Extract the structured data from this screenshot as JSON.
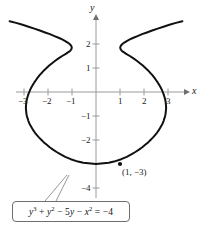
{
  "figure": {
    "width": 204,
    "height": 226,
    "background": "#ffffff",
    "curve_color": "#111111",
    "axis_color": "#9a9a9a",
    "text_color": "#1a1a1a"
  },
  "axes": {
    "x_label": "x",
    "y_label": "y",
    "origin_px": {
      "x": 96,
      "y": 92
    },
    "unit_px": 24,
    "x_ticks": [
      {
        "value": -3,
        "label": "−3"
      },
      {
        "value": -2,
        "label": "−2"
      },
      {
        "value": -1,
        "label": "−1"
      },
      {
        "value": 1,
        "label": "1"
      },
      {
        "value": 2,
        "label": "2"
      },
      {
        "value": 3,
        "label": "3"
      }
    ],
    "y_ticks": [
      {
        "value": 2,
        "label": "2"
      },
      {
        "value": 1,
        "label": "1"
      },
      {
        "value": -1,
        "label": "−1"
      },
      {
        "value": -2,
        "label": "−2"
      },
      {
        "value": -4,
        "label": "−4"
      }
    ]
  },
  "annotations": {
    "point_label": "(1, −3)",
    "point_value": {
      "x": 1,
      "y": -3
    },
    "equation_parts": {
      "y_cubed_base": "y",
      "y_cubed_exp": "3",
      "plus_1": " + ",
      "y_squared_base": "y",
      "y_squared_exp": "2",
      "minus_1": " − 5",
      "five_y": "y",
      "minus_2": " − ",
      "x_squared_base": "x",
      "x_squared_exp": "2",
      "equals": " = −4"
    },
    "equation_plain": "y³ + y² − 5y − x² = −4"
  },
  "chart_data": {
    "type": "line",
    "title": "",
    "xlabel": "x",
    "ylabel": "y",
    "xlim": [
      -3.8,
      3.8
    ],
    "ylim": [
      -4.6,
      3.0
    ],
    "grid": false,
    "legend": null,
    "equation": "y^3 + y^2 - 5y - x^2 = -4",
    "annotated_points": [
      {
        "x": 1,
        "y": -3,
        "label": "(1, −3)"
      }
    ],
    "x_ticks": [
      -3,
      -2,
      -1,
      1,
      2,
      3
    ],
    "y_ticks": [
      2,
      1,
      -1,
      -2,
      -4
    ],
    "series": [
      {
        "name": "right branch (x = +sqrt)",
        "points": [
          [
            0.0,
            -3.0
          ],
          [
            0.53,
            -2.95
          ],
          [
            0.75,
            -2.9
          ],
          [
            1.05,
            -2.8
          ],
          [
            1.28,
            -2.7
          ],
          [
            1.47,
            -2.6
          ],
          [
            1.64,
            -2.5
          ],
          [
            1.79,
            -2.4
          ],
          [
            1.93,
            -2.3
          ],
          [
            2.05,
            -2.2
          ],
          [
            2.17,
            -2.1
          ],
          [
            2.27,
            -2.0
          ],
          [
            2.37,
            -1.9
          ],
          [
            2.46,
            -1.8
          ],
          [
            2.54,
            -1.7
          ],
          [
            2.61,
            -1.6
          ],
          [
            2.67,
            -1.5
          ],
          [
            2.73,
            -1.4
          ],
          [
            2.78,
            -1.3
          ],
          [
            2.82,
            -1.2
          ],
          [
            2.85,
            -1.1
          ],
          [
            2.88,
            -1.0
          ],
          [
            2.9,
            -0.9
          ],
          [
            2.91,
            -0.8
          ],
          [
            2.92,
            -0.7
          ],
          [
            2.92,
            -0.6
          ],
          [
            2.91,
            -0.5
          ],
          [
            2.9,
            -0.4
          ],
          [
            2.88,
            -0.3
          ],
          [
            2.85,
            -0.2
          ],
          [
            2.82,
            -0.1
          ],
          [
            2.78,
            0.0
          ],
          [
            2.74,
            0.1
          ],
          [
            2.69,
            0.2
          ],
          [
            2.63,
            0.3
          ],
          [
            2.57,
            0.4
          ],
          [
            2.5,
            0.5
          ],
          [
            2.43,
            0.6
          ],
          [
            2.35,
            0.7
          ],
          [
            2.26,
            0.8
          ],
          [
            2.17,
            0.9
          ],
          [
            2.06,
            1.0
          ],
          [
            1.95,
            1.1
          ],
          [
            1.83,
            1.2
          ],
          [
            1.7,
            1.3
          ],
          [
            1.56,
            1.4
          ],
          [
            1.41,
            1.5
          ],
          [
            1.24,
            1.6
          ],
          [
            1.2,
            1.63
          ],
          [
            1.12,
            1.68
          ],
          [
            1.07,
            1.72
          ],
          [
            1.04,
            1.76
          ],
          [
            1.02,
            1.8
          ],
          [
            1.01,
            1.85
          ],
          [
            1.02,
            1.9
          ],
          [
            1.05,
            1.95
          ],
          [
            1.1,
            2.0
          ],
          [
            1.18,
            2.06
          ],
          [
            1.28,
            2.12
          ],
          [
            1.41,
            2.19
          ],
          [
            1.56,
            2.26
          ],
          [
            1.73,
            2.33
          ],
          [
            1.92,
            2.41
          ],
          [
            2.12,
            2.48
          ],
          [
            2.34,
            2.56
          ],
          [
            2.57,
            2.64
          ],
          [
            2.81,
            2.72
          ],
          [
            3.06,
            2.8
          ],
          [
            3.33,
            2.88
          ],
          [
            3.6,
            2.95
          ]
        ]
      },
      {
        "name": "left branch (x = -sqrt)",
        "points": [
          [
            0.0,
            -3.0
          ],
          [
            -0.53,
            -2.95
          ],
          [
            -0.75,
            -2.9
          ],
          [
            -1.05,
            -2.8
          ],
          [
            -1.28,
            -2.7
          ],
          [
            -1.47,
            -2.6
          ],
          [
            -1.64,
            -2.5
          ],
          [
            -1.79,
            -2.4
          ],
          [
            -1.93,
            -2.3
          ],
          [
            -2.05,
            -2.2
          ],
          [
            -2.17,
            -2.1
          ],
          [
            -2.27,
            -2.0
          ],
          [
            -2.37,
            -1.9
          ],
          [
            -2.46,
            -1.8
          ],
          [
            -2.54,
            -1.7
          ],
          [
            -2.61,
            -1.6
          ],
          [
            -2.67,
            -1.5
          ],
          [
            -2.73,
            -1.4
          ],
          [
            -2.78,
            -1.3
          ],
          [
            -2.82,
            -1.2
          ],
          [
            -2.85,
            -1.1
          ],
          [
            -2.88,
            -1.0
          ],
          [
            -2.9,
            -0.9
          ],
          [
            -2.91,
            -0.8
          ],
          [
            -2.92,
            -0.7
          ],
          [
            -2.92,
            -0.6
          ],
          [
            -2.91,
            -0.5
          ],
          [
            -2.9,
            -0.4
          ],
          [
            -2.88,
            -0.3
          ],
          [
            -2.85,
            -0.2
          ],
          [
            -2.82,
            -0.1
          ],
          [
            -2.78,
            0.0
          ],
          [
            -2.74,
            0.1
          ],
          [
            -2.69,
            0.2
          ],
          [
            -2.63,
            0.3
          ],
          [
            -2.57,
            0.4
          ],
          [
            -2.5,
            0.5
          ],
          [
            -2.43,
            0.6
          ],
          [
            -2.35,
            0.7
          ],
          [
            -2.26,
            0.8
          ],
          [
            -2.17,
            0.9
          ],
          [
            -2.06,
            1.0
          ],
          [
            -1.95,
            1.1
          ],
          [
            -1.83,
            1.2
          ],
          [
            -1.7,
            1.3
          ],
          [
            -1.56,
            1.4
          ],
          [
            -1.41,
            1.5
          ],
          [
            -1.24,
            1.6
          ],
          [
            -1.2,
            1.63
          ],
          [
            -1.12,
            1.68
          ],
          [
            -1.07,
            1.72
          ],
          [
            -1.04,
            1.76
          ],
          [
            -1.02,
            1.8
          ],
          [
            -1.01,
            1.85
          ],
          [
            -1.02,
            1.9
          ],
          [
            -1.05,
            1.95
          ],
          [
            -1.1,
            2.0
          ],
          [
            -1.18,
            2.06
          ],
          [
            -1.28,
            2.12
          ],
          [
            -1.41,
            2.19
          ],
          [
            -1.56,
            2.26
          ],
          [
            -1.73,
            2.33
          ],
          [
            -1.92,
            2.41
          ],
          [
            -2.12,
            2.48
          ],
          [
            -2.34,
            2.56
          ],
          [
            -2.57,
            2.64
          ],
          [
            -2.81,
            2.72
          ],
          [
            -3.06,
            2.8
          ],
          [
            -3.33,
            2.88
          ],
          [
            -3.6,
            2.95
          ]
        ]
      }
    ]
  }
}
